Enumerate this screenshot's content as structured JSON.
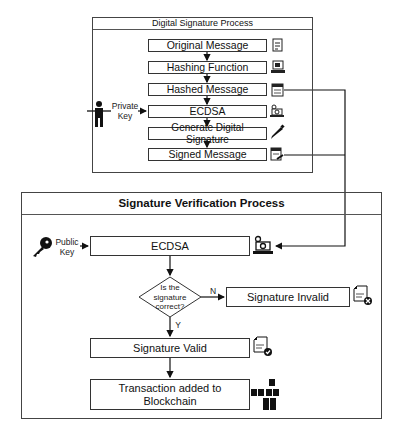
{
  "signing": {
    "title": "Digital Signature Process",
    "steps": [
      {
        "label": "Original Message",
        "icon": "document-icon"
      },
      {
        "label": "Hashing Function",
        "icon": "computer-icon"
      },
      {
        "label": "Hashed Message",
        "icon": "hash-document-icon"
      },
      {
        "label": "ECDSA",
        "icon": "crypto-laptop-icon"
      },
      {
        "label": "Generate Digital Signature",
        "icon": "pen-icon"
      },
      {
        "label": "Signed Message",
        "icon": "signed-document-icon"
      }
    ],
    "actor_label_1": "Private",
    "actor_label_2": "Key",
    "actor_icon": "person-icon"
  },
  "verification": {
    "title": "Signature Verification Process",
    "key_label_1": "Public",
    "key_label_2": "Key",
    "key_icon": "key-icon",
    "ecdsa_label": "ECDSA",
    "decision_line_1": "Is the",
    "decision_line_2": "signature",
    "decision_line_3": "correct?",
    "no_label": "N",
    "yes_label": "Y",
    "invalid_label": "Signature Invalid",
    "valid_label": "Signature Valid",
    "transaction_line_1": "Transaction added to",
    "transaction_line_2": "Blockchain"
  },
  "colors": {
    "line": "#111111",
    "border": "#444444",
    "background": "#ffffff"
  }
}
